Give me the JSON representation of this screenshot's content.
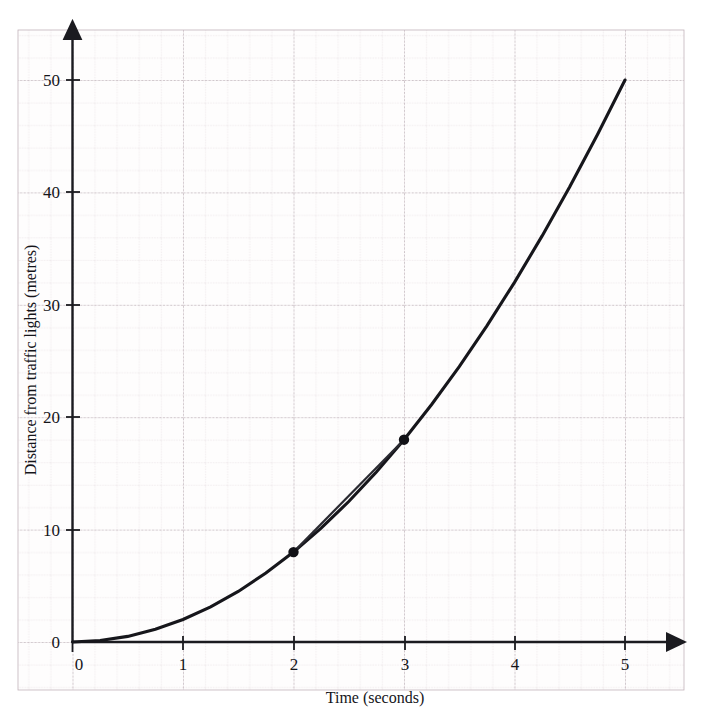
{
  "figure": {
    "name": "distance-time-graph",
    "background_color": "#ffffff",
    "grid_minor_color": "#cdbfc6",
    "grid_major_color": "#b2a3ab",
    "axis_color": "#1b1b20",
    "curve_color": "#16161b",
    "chord_color": "#2a2a31",
    "point_color": "#111116"
  },
  "chart_data": {
    "type": "line",
    "title": "",
    "xlabel": "Time (seconds)",
    "ylabel": "Distance from traffic lights (metres)",
    "xlim": [
      0,
      5.6
    ],
    "ylim": [
      0,
      55
    ],
    "xticks": [
      0,
      1,
      2,
      3,
      4,
      5
    ],
    "xtick_labels": [
      "0",
      "1",
      "2",
      "3",
      "4",
      "5"
    ],
    "yticks": [
      10,
      20,
      30,
      40,
      50
    ],
    "ytick_labels": [
      "10",
      "20",
      "30",
      "40",
      "50"
    ],
    "y_origin_label": "0",
    "grid": true,
    "grid_major_step_x": 1,
    "grid_major_step_y": 10,
    "grid_minor_divisions": 5,
    "legend": "none",
    "series": [
      {
        "name": "distance curve",
        "kind": "curve",
        "equation": "d = 2t^2",
        "x": [
          0,
          0.25,
          0.5,
          0.75,
          1,
          1.25,
          1.5,
          1.75,
          2,
          2.25,
          2.5,
          2.75,
          3,
          3.25,
          3.5,
          3.75,
          4,
          4.25,
          4.5,
          4.75,
          5
        ],
        "y": [
          0,
          0.13,
          0.5,
          1.13,
          2,
          3.13,
          4.5,
          6.13,
          8,
          10.13,
          12.5,
          15.13,
          18,
          21.13,
          24.5,
          28.13,
          32,
          36.13,
          40.5,
          45.13,
          50
        ]
      },
      {
        "name": "chord",
        "kind": "segment",
        "x": [
          2,
          3
        ],
        "y": [
          8,
          18
        ]
      }
    ],
    "markers": [
      {
        "label": "P",
        "x": 2,
        "y": 8
      },
      {
        "label": "Q",
        "x": 3,
        "y": 18
      }
    ]
  }
}
